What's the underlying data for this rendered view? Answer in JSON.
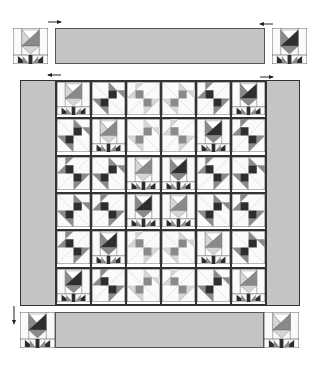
{
  "diagram": {
    "colors": {
      "border_fill": "#c4c4c4",
      "outline": "#333333",
      "dark": "#2e2e2e",
      "medium": "#8a8a8a",
      "light": "#d6d6d6",
      "background": "#fafafa"
    },
    "top_row": {
      "left_block": {
        "type": "tulip",
        "tone": "light"
      },
      "sashing": "top-border-strip",
      "right_block": {
        "type": "tulip",
        "tone": "dark"
      },
      "arrows": [
        {
          "direction": "right",
          "label": "attach-left"
        },
        {
          "direction": "left",
          "label": "attach-right"
        }
      ]
    },
    "center": {
      "side_arrows": [
        {
          "direction": "left"
        },
        {
          "direction": "right"
        }
      ],
      "rows": 6,
      "cols": 6,
      "blocks": [
        [
          "tulip-light",
          "star-dark",
          "star-light",
          "star-light",
          "star-dark",
          "tulip-dark"
        ],
        [
          "star-dark",
          "tulip-light",
          "star-light",
          "star-light",
          "tulip-dark",
          "star-dark"
        ],
        [
          "star-dark",
          "star-dark",
          "tulip-light",
          "tulip-dark",
          "star-dark",
          "star-dark"
        ],
        [
          "star-dark",
          "star-dark",
          "tulip-dark",
          "tulip-light",
          "star-dark",
          "star-dark"
        ],
        [
          "star-dark",
          "tulip-dark",
          "star-light",
          "star-light",
          "tulip-light",
          "star-dark"
        ],
        [
          "tulip-dark",
          "star-dark",
          "star-light",
          "star-light",
          "star-dark",
          "tulip-light"
        ]
      ]
    },
    "bottom_row": {
      "arrow": {
        "direction": "down"
      },
      "left_block": {
        "type": "tulip",
        "tone": "dark"
      },
      "sashing": "bottom-border-strip",
      "right_block": {
        "type": "tulip",
        "tone": "light"
      }
    }
  }
}
